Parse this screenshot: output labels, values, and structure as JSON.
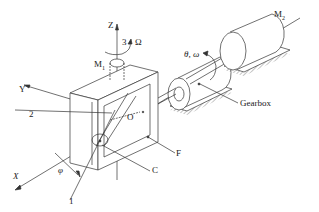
{
  "figure": {
    "labels": {
      "z_axis": "Z",
      "y_axis": "Y",
      "x_axis": "X",
      "axis_3": "3",
      "omega_cap": "Ω",
      "m1_base": "M",
      "m1_sub": "1",
      "m2_base": "M",
      "m2_sub": "2",
      "theta_omega": "θ, ω",
      "gearbox": "Gearbox",
      "axis_2": "2",
      "origin": "O",
      "frame": "F",
      "c_label": "C",
      "axis_1": "1",
      "phi": "φ"
    },
    "colors": {
      "line": "#333333",
      "background": "#ffffff"
    }
  }
}
